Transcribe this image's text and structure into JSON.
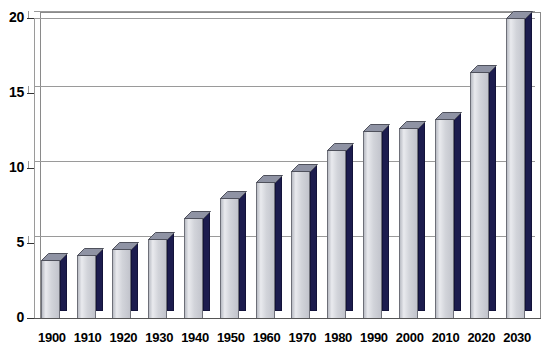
{
  "chart_data": {
    "type": "bar",
    "title": "",
    "subtitle": "",
    "xlabel": "",
    "ylabel": "",
    "categories": [
      "1900",
      "1910",
      "1920",
      "1930",
      "1940",
      "1950",
      "1960",
      "1970",
      "1980",
      "1990",
      "2000",
      "2010",
      "2020",
      "2030"
    ],
    "values": [
      3.9,
      4.2,
      4.6,
      5.3,
      6.7,
      8.0,
      9.1,
      9.8,
      11.2,
      12.5,
      12.7,
      13.3,
      16.4,
      20.0
    ],
    "series": [
      {
        "name": "",
        "values": [
          3.9,
          4.2,
          4.6,
          5.3,
          6.7,
          8.0,
          9.1,
          9.8,
          11.2,
          12.5,
          12.7,
          13.3,
          16.4,
          20.0
        ]
      }
    ],
    "ylim": [
      0,
      20
    ],
    "yticks": [
      0,
      5,
      10,
      15,
      20
    ],
    "ytick_labels": [
      "0",
      "5",
      "10",
      "15",
      "20"
    ],
    "grid": true,
    "grid_axis": "y",
    "legend": false,
    "legend_position": "none",
    "style": "3d-column",
    "annotations": []
  },
  "colors": {
    "bar_front_light": "#e9eaee",
    "bar_front_mid": "#d2d4da",
    "bar_side_navy": "#1c1c4e",
    "bar_top_gray": "#8f93a4",
    "bar_outline": "#6d6f78",
    "gridline": "#9a9a9a",
    "frame": "#8a8a8a",
    "axis_text": "#000000",
    "background": "#ffffff"
  },
  "axes": {
    "y_axis_name": "value-axis",
    "x_axis_name": "category-axis"
  }
}
